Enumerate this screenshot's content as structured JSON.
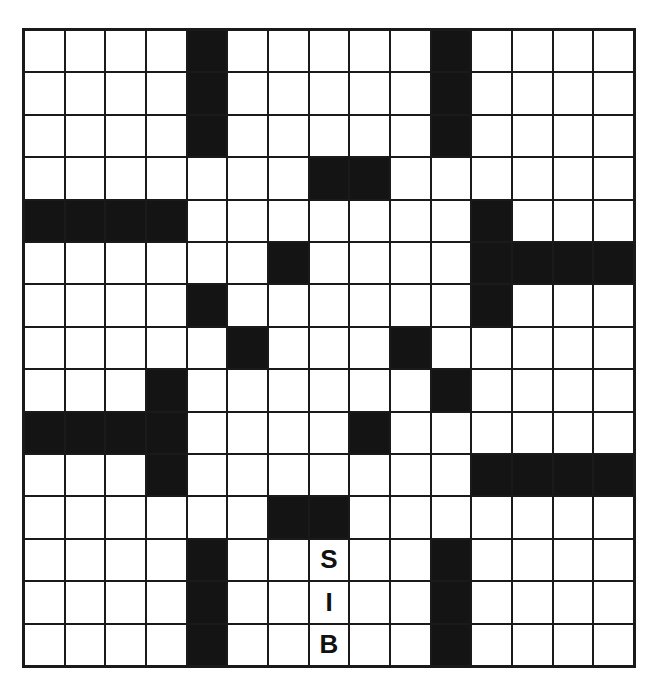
{
  "puzzle": {
    "rows": 15,
    "cols": 15,
    "colors": {
      "black": "#141414",
      "white": "#ffffff",
      "line": "#1a1a1a"
    },
    "black_cells": [
      [
        0,
        4
      ],
      [
        0,
        10
      ],
      [
        1,
        4
      ],
      [
        1,
        10
      ],
      [
        2,
        4
      ],
      [
        2,
        10
      ],
      [
        3,
        7
      ],
      [
        3,
        8
      ],
      [
        4,
        0
      ],
      [
        4,
        1
      ],
      [
        4,
        2
      ],
      [
        4,
        3
      ],
      [
        4,
        11
      ],
      [
        5,
        6
      ],
      [
        5,
        11
      ],
      [
        5,
        12
      ],
      [
        5,
        13
      ],
      [
        5,
        14
      ],
      [
        6,
        4
      ],
      [
        6,
        11
      ],
      [
        7,
        5
      ],
      [
        7,
        9
      ],
      [
        8,
        3
      ],
      [
        8,
        10
      ],
      [
        9,
        0
      ],
      [
        9,
        1
      ],
      [
        9,
        2
      ],
      [
        9,
        3
      ],
      [
        9,
        8
      ],
      [
        10,
        3
      ],
      [
        10,
        11
      ],
      [
        10,
        12
      ],
      [
        10,
        13
      ],
      [
        10,
        14
      ],
      [
        11,
        6
      ],
      [
        11,
        7
      ],
      [
        12,
        4
      ],
      [
        12,
        10
      ],
      [
        13,
        4
      ],
      [
        13,
        10
      ],
      [
        14,
        4
      ],
      [
        14,
        10
      ]
    ],
    "letters": [
      {
        "row": 12,
        "col": 7,
        "value": "S"
      },
      {
        "row": 13,
        "col": 7,
        "value": "I"
      },
      {
        "row": 14,
        "col": 7,
        "value": "B"
      }
    ]
  }
}
